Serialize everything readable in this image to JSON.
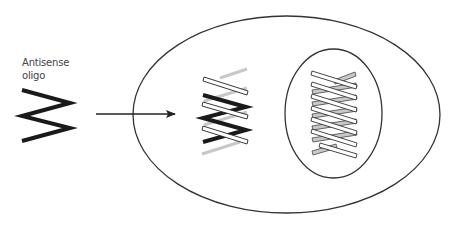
{
  "diagram": {
    "label_line1": "Antisense",
    "label_line2": "oligo",
    "elements": {
      "antisense_oligo": "zigzag strand (black)",
      "arrow": "entry into cell",
      "cell": "outer ellipse",
      "cytoplasm_hybrid": "antisense oligo bound to mRNA (white bars + gray strand)",
      "nucleus": "inner ellipse",
      "nuclear_dna": "double helix (white and gray strands)"
    },
    "colors": {
      "outline": "#333333",
      "oligo": "#1a1a1a",
      "strand_white": "#ffffff",
      "strand_gray": "#c8c8c8",
      "label": "#444444"
    }
  }
}
